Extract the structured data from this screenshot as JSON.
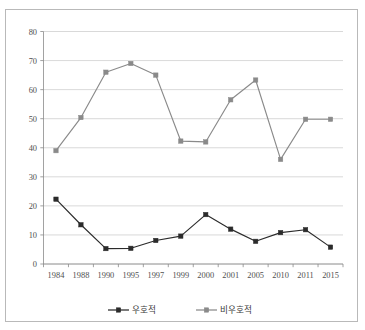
{
  "chart_data": {
    "type": "line",
    "title": "",
    "xlabel": "",
    "ylabel": "",
    "categories": [
      "1984",
      "1988",
      "1990",
      "1995",
      "1997",
      "1999",
      "2000",
      "2001",
      "2005",
      "2010",
      "2011",
      "2015"
    ],
    "ylim": [
      0,
      80
    ],
    "ytick_labels": [
      "0",
      "10",
      "20",
      "30",
      "40",
      "50",
      "60",
      "70",
      "80"
    ],
    "ytick_values": [
      0,
      10,
      20,
      30,
      40,
      50,
      60,
      70,
      80
    ],
    "grid": true,
    "legend_position": "bottom",
    "series": [
      {
        "name": "우호적",
        "color": "#2b2b2b",
        "marker": "square",
        "values": [
          22.3,
          13.5,
          5.3,
          5.4,
          8.1,
          9.6,
          17.0,
          12.0,
          7.8,
          10.8,
          11.8,
          5.8
        ]
      },
      {
        "name": "비우호적",
        "color": "#8a8a8a",
        "marker": "square",
        "values": [
          39.0,
          50.4,
          66.0,
          69.0,
          65.0,
          42.3,
          42.0,
          56.5,
          63.3,
          36.0,
          49.8,
          49.8
        ]
      }
    ]
  },
  "legend": {
    "items": [
      {
        "label": "우호적",
        "color": "#2b2b2b"
      },
      {
        "label": "비우호적",
        "color": "#8a8a8a"
      }
    ]
  },
  "axes": {
    "y_min_label": "0",
    "y_max_label": "80"
  }
}
